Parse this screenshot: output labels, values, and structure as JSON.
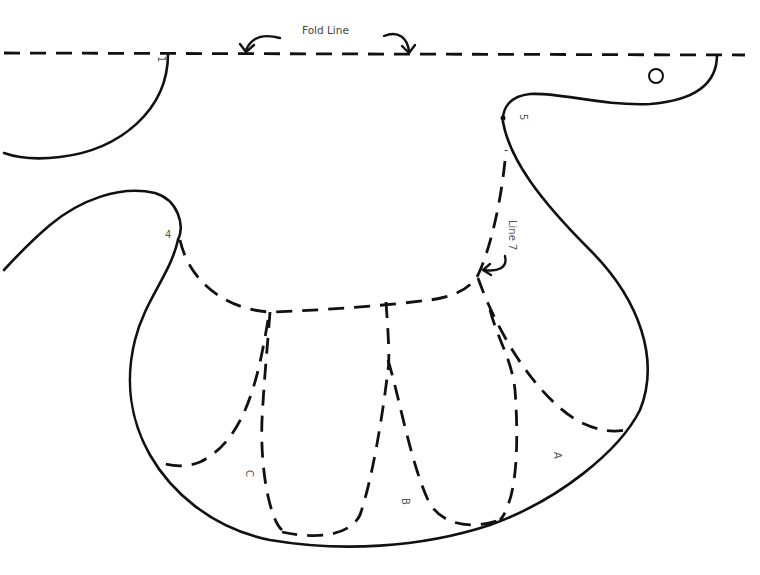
{
  "diagram": {
    "type": "sewing-pattern-piece",
    "fold_line_label": "Fold Line",
    "seam_label": "Line 7",
    "point_labels": [
      "1",
      "4",
      "5"
    ],
    "section_labels": [
      "A",
      "B",
      "C"
    ],
    "circle_marker": "O",
    "line_color": "#111111",
    "label_color": "#555555"
  }
}
